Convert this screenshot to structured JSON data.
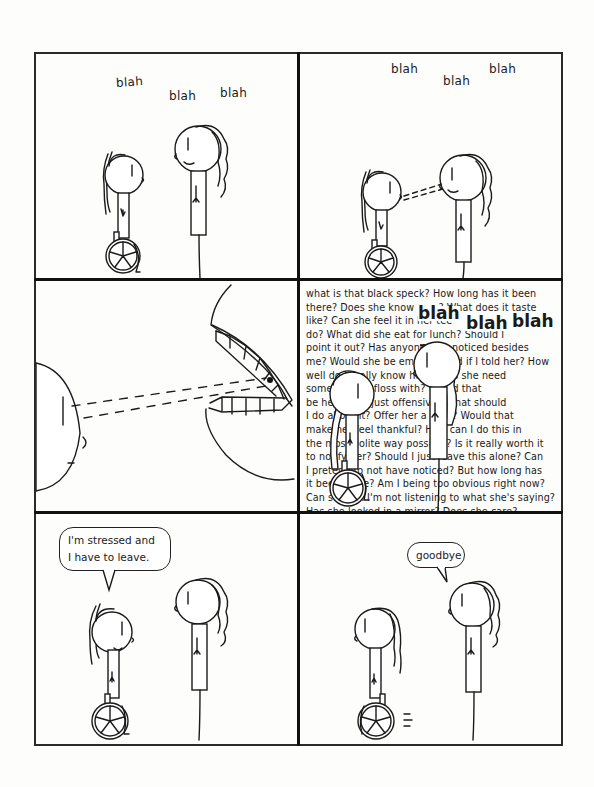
{
  "comic": {
    "panels": [
      {
        "id": 1,
        "description": "Wheelchair user looks up at standing person who is talking",
        "sound_text": [
          "blah",
          "blah",
          "blah"
        ]
      },
      {
        "id": 2,
        "description": "Wheelchair user stares (dashed gaze lines) at standing person's mouth while they talk",
        "sound_text": [
          "blah",
          "blah",
          "blah"
        ]
      },
      {
        "id": 3,
        "description": "Close-up: gaze lines aimed at a black speck on the talking person's teeth"
      },
      {
        "id": 4,
        "description": "Inner monologue text fills panel behind the two characters",
        "inner_monologue": [
          "what is that black speck? How long has it been",
          "there? Does she know",
          "? What does it taste",
          "like? Can she feel it in her tee",
          "at s",
          "o",
          "do? What did she eat for lunch? Should I",
          "point it out? Has anyone else noticed besides",
          "me? Would she be embarrassed if I told her? How",
          "well do I really know her? Does she need",
          "something to floss with? Would that",
          "be helpful or just offensive? What should",
          "I do about it? Offer her a mint? Would that",
          "make her feel thankful? How can I do this in",
          "the most polite way possible? Is it really worth it",
          "to notify her? Should I just leave this alone? Can",
          "I pretend to not have noticed? But how long has",
          "it been there? Am I being too obvious right now?",
          "Can she tell I'm not listening to what she's saying?",
          "Has she looked in a mirror? Does she care?"
        ],
        "inner_monologue_visible": [
          "what is that black speck? How long has it been",
          "there? Does she know blah? What does it taste",
          "like? Can she feel it in her tee blah at s blah o",
          "do? What did she eat for lunch? Should I",
          "point it out? Has anyone el... ticed besides",
          "me? Would she be embar... ld her? How",
          "well do I r... now her? ...es she need",
          "Somethi... se with? ...ould that",
          "be helpf... st offensiv... What should",
          "I do abo... ffer her a mi... Would that",
          "make h... thankful? Ho... n I do this in",
          "the most po... way possible? ...t really worth it",
          "to notify h... should I just le... this alone? Can",
          "I pretend t... have Noticed? But how long has",
          "it been th... Am I being too obvious right Now?",
          "Can she t... ot listening to what she's saying?",
          "... ed in a mirror? Does she care?"
        ],
        "overlay_blahs": [
          "blah",
          "blah",
          "blah"
        ]
      },
      {
        "id": 5,
        "description": "Wheelchair user speaks",
        "speech": [
          "I'm stressed and",
          "I have to leave."
        ]
      },
      {
        "id": 6,
        "description": "Standing person says goodbye as wheelchair user rolls away",
        "speech": [
          "goodbye"
        ]
      }
    ],
    "colors": {
      "ink": "#1a1a1a",
      "paper": "#fdfdfc"
    }
  }
}
